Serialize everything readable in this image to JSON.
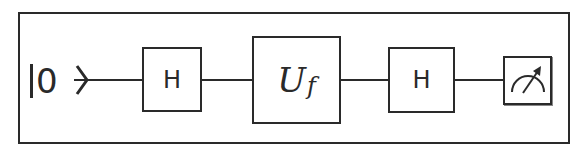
{
  "diagram": {
    "type": "quantum-circuit",
    "input_state": {
      "bar": "|",
      "value": "0",
      "closing": "⟩"
    },
    "gates": [
      {
        "id": "h1",
        "label": "H"
      },
      {
        "id": "uf",
        "label_main": "U",
        "label_sub": "f"
      },
      {
        "id": "h2",
        "label": "H"
      }
    ],
    "measurement": {
      "icon": "meter-icon"
    },
    "colors": {
      "stroke": "#2a2a2a",
      "background": "#ffffff"
    }
  }
}
